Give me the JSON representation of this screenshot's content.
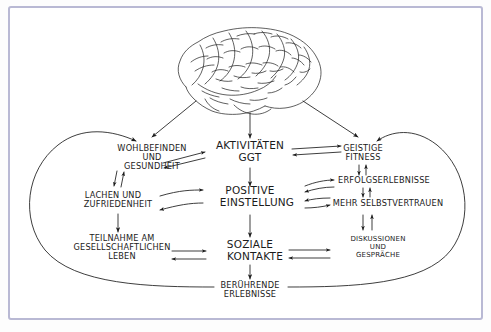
{
  "diagram": {
    "title_text": "",
    "source_kind": "hand-drawn-concept-map",
    "language": "de",
    "frame_color": "#b9b9d4",
    "ink_color": "#1b1b1b",
    "background_color": "#ffffff",
    "brain": {
      "label": "brain-illustration",
      "description": "hand-drawn lateral view of a human brain"
    },
    "nodes": [
      {
        "id": "wohlbefinden",
        "lines": [
          "WOHLBEFINDEN",
          "UND",
          "GESUNDHEIT"
        ],
        "x": 152,
        "y": 155,
        "size": "sz-med"
      },
      {
        "id": "aktivitaeten",
        "lines": [
          "AKTIVITÄTEN",
          "GGT"
        ],
        "x": 250,
        "y": 154,
        "size": "sz-big"
      },
      {
        "id": "geistige-fitness",
        "lines": [
          "GEISTIGE",
          "FITNESS",
          ""
        ],
        "x": 363,
        "y": 154,
        "size": "sz-med"
      },
      {
        "id": "lachen",
        "lines": [
          "LACHEN  UND",
          "ZUFRIEDENHEIT",
          ""
        ],
        "x": 113,
        "y": 200,
        "size": "sz-med"
      },
      {
        "id": "positive-einstellung",
        "lines": [
          "POSITIVE",
          "EINSTELLUNG",
          ""
        ],
        "x": 250,
        "y": 199,
        "size": "sz-big"
      },
      {
        "id": "erfolgserlebnisse",
        "lines": [
          "ERFOLGSERLEBNISSE",
          "",
          ""
        ],
        "x": 380,
        "y": 182,
        "size": "sz-med"
      },
      {
        "id": "mehr-selbstvertrauen",
        "lines": [
          "MEHR  SELBSTVERTRAUEN",
          "",
          ""
        ],
        "x": 385,
        "y": 205,
        "size": "sz-med"
      },
      {
        "id": "teilnahme",
        "lines": [
          "TEILNAHME AM",
          "GESELLSCHAFTLICHEN",
          "LEBEN"
        ],
        "x": 122,
        "y": 245,
        "size": "sz-med"
      },
      {
        "id": "soziale-kontakte",
        "lines": [
          "SOZIALE",
          "KONTAKTE",
          ""
        ],
        "x": 250,
        "y": 250,
        "size": "sz-big"
      },
      {
        "id": "diskussionen",
        "lines": [
          "DISKUSSIONEN",
          "UND",
          "GESPRÄCHE"
        ],
        "x": 378,
        "y": 247,
        "size": "sz-sml"
      },
      {
        "id": "beruehrende",
        "lines": [
          "BERÜHRENDE",
          "ERLEBNISSE",
          ""
        ],
        "x": 250,
        "y": 290,
        "size": "sz-med"
      }
    ],
    "connections": [
      {
        "id": "brain-to-wohlbefinden",
        "from": "brain",
        "to": "wohlbefinden",
        "style": "single"
      },
      {
        "id": "brain-to-aktivitaeten",
        "from": "brain",
        "to": "aktivitaeten",
        "style": "single"
      },
      {
        "id": "brain-to-geistige-fitness",
        "from": "brain",
        "to": "geistige-fitness",
        "style": "single"
      },
      {
        "id": "wohlbefinden-aktivitaeten",
        "from": "wohlbefinden",
        "to": "aktivitaeten",
        "style": "double"
      },
      {
        "id": "aktivitaeten-geistige",
        "from": "aktivitaeten",
        "to": "geistige-fitness",
        "style": "double"
      },
      {
        "id": "wohlbefinden-lachen",
        "from": "wohlbefinden",
        "to": "lachen",
        "style": "double-vertical"
      },
      {
        "id": "aktivitaeten-positive",
        "from": "aktivitaeten",
        "to": "positive-einstellung",
        "style": "single-vertical"
      },
      {
        "id": "geistige-erfolgs",
        "from": "geistige-fitness",
        "to": "erfolgserlebnisse",
        "style": "double-vertical"
      },
      {
        "id": "lachen-positive",
        "from": "lachen",
        "to": "positive-einstellung",
        "style": "double"
      },
      {
        "id": "positive-erfolgs",
        "from": "positive-einstellung",
        "to": "erfolgserlebnisse",
        "style": "double"
      },
      {
        "id": "positive-selbstvertrauen",
        "from": "positive-einstellung",
        "to": "mehr-selbstvertrauen",
        "style": "double"
      },
      {
        "id": "erfolgs-selbstvertrauen",
        "from": "erfolgserlebnisse",
        "to": "mehr-selbstvertrauen",
        "style": "double-vertical"
      },
      {
        "id": "lachen-teilnahme",
        "from": "lachen",
        "to": "teilnahme",
        "style": "single-vertical"
      },
      {
        "id": "positive-soziale",
        "from": "positive-einstellung",
        "to": "soziale-kontakte",
        "style": "single-vertical"
      },
      {
        "id": "selbstvertrauen-diskussionen",
        "from": "mehr-selbstvertrauen",
        "to": "diskussionen",
        "style": "double-vertical"
      },
      {
        "id": "teilnahme-soziale",
        "from": "teilnahme",
        "to": "soziale-kontakte",
        "style": "double"
      },
      {
        "id": "soziale-diskussionen",
        "from": "soziale-kontakte",
        "to": "diskussionen",
        "style": "double"
      },
      {
        "id": "soziale-beruehrende",
        "from": "soziale-kontakte",
        "to": "beruehrende",
        "style": "single-vertical"
      },
      {
        "id": "beruehrende-loop-left",
        "from": "beruehrende",
        "to": "wohlbefinden",
        "style": "big-loop-left"
      },
      {
        "id": "beruehrende-loop-right",
        "from": "beruehrende",
        "to": "geistige-fitness",
        "style": "big-loop-right"
      }
    ]
  }
}
